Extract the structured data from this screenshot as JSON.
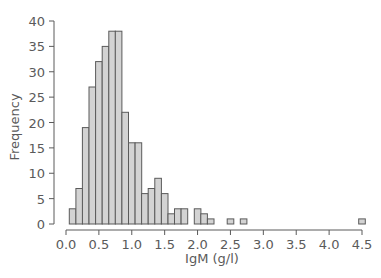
{
  "chart_data": {
    "type": "bar",
    "subtype": "histogram",
    "title": "",
    "xlabel": "IgM (g/l)",
    "ylabel": "Frequency",
    "bin_width": 0.1,
    "x": [
      0.1,
      0.2,
      0.3,
      0.4,
      0.5,
      0.6,
      0.7,
      0.8,
      0.9,
      1.0,
      1.1,
      1.2,
      1.3,
      1.4,
      1.5,
      1.6,
      1.7,
      1.8,
      1.9,
      2.0,
      2.1,
      2.2,
      2.5,
      2.7,
      4.5
    ],
    "values": [
      3,
      7,
      19,
      27,
      32,
      35,
      38,
      38,
      22,
      16,
      16,
      6,
      7,
      9,
      6,
      2,
      3,
      3,
      0,
      3,
      2,
      1,
      1,
      1,
      1
    ],
    "xlim": [
      0.0,
      4.5
    ],
    "ylim": [
      0,
      40
    ],
    "xticks": [
      "0.0",
      "0.5",
      "1.0",
      "1.5",
      "2.0",
      "2.5",
      "3.0",
      "3.5",
      "4.0",
      "4.5"
    ],
    "yticks": [
      "0",
      "5",
      "10",
      "15",
      "20",
      "25",
      "30",
      "35",
      "40"
    ],
    "grid": false,
    "legend": null,
    "colors": {
      "bar_fill": "#d3d3d3",
      "bar_edge": "#5a5a5a",
      "axis": "#5a5a5a"
    }
  }
}
